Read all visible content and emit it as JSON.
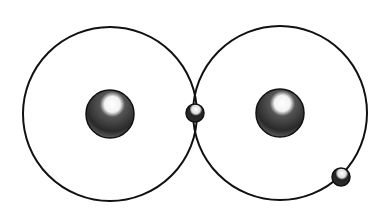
{
  "diagram": {
    "type": "atomic-bond-illustration",
    "colors": {
      "background": "#ffffff",
      "line": "#111111",
      "nucleus": "#2a2a2a",
      "highlight": "#ffffff"
    },
    "atoms": [
      {
        "id": "left-atom",
        "orbit": {
          "cx": 110,
          "cy": 114,
          "r": 87
        },
        "nucleus": {
          "cx": 110,
          "cy": 114,
          "r": 24
        }
      },
      {
        "id": "right-atom",
        "orbit": {
          "cx": 280,
          "cy": 113,
          "r": 87
        },
        "nucleus": {
          "cx": 280,
          "cy": 113,
          "r": 24
        }
      }
    ],
    "electrons": [
      {
        "id": "shared-electron",
        "cx": 195,
        "cy": 113,
        "r": 9
      },
      {
        "id": "orbit-electron",
        "cx": 341,
        "cy": 177,
        "r": 9
      }
    ]
  }
}
